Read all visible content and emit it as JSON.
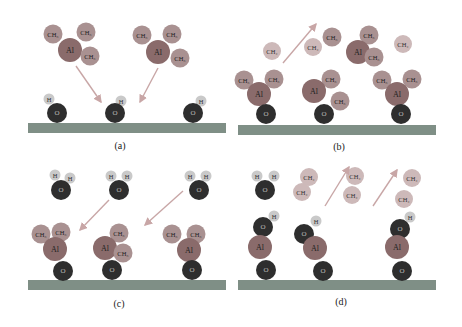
{
  "figure": {
    "colors": {
      "substrate": "#7f8f86",
      "oxygen": "#2e2e2e",
      "hydrogen": "#c9c9c9",
      "aluminum": "#8a6b6b",
      "methyl": "#a99191",
      "methane": "#cdb9b9",
      "arrow": "#c8a6a6"
    },
    "labels": {
      "O": "O",
      "H": "H",
      "Al": "Al",
      "CH3": "CH₃",
      "CH4": "CH₄"
    },
    "panels": [
      {
        "id": "a",
        "caption": "(a)"
      },
      {
        "id": "b",
        "caption": "(b)"
      },
      {
        "id": "c",
        "caption": "(c)"
      },
      {
        "id": "d",
        "caption": "(d)"
      }
    ]
  }
}
